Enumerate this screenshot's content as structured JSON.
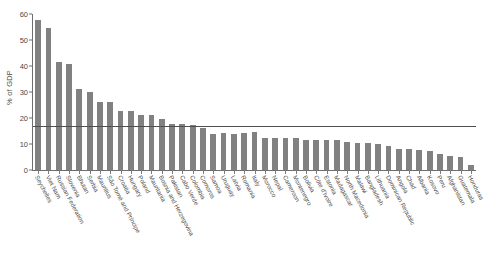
{
  "chart_data": {
    "type": "bar",
    "title": "",
    "xlabel": "",
    "ylabel": "% of GDP",
    "ylim": [
      0,
      60
    ],
    "yticks": [
      0,
      10,
      20,
      30,
      40,
      50,
      60
    ],
    "grid": false,
    "legend": null,
    "bar_color": "#818181",
    "axis_color": "#6e6e6e",
    "reference_line": {
      "value": 16.5,
      "color": "#4f4f4f",
      "orientation": "horizontal"
    },
    "categories": [
      "Seychelles",
      "Viet Nam",
      "Russian Federation",
      "Slovenia",
      "Bhutan",
      "Serbia",
      "Mauritius",
      "São Tomé and Príncipe",
      "Croatia",
      "Hungary",
      "Poland",
      "Mauritania",
      "Bosnia and Herzegovina",
      "Pakistan",
      "Cabo Verde",
      "Colombia",
      "Comoros",
      "Samoa",
      "Uruguay",
      "Latvia",
      "Romania",
      "Italy",
      "Morocco",
      "Nepal",
      "Cameroon",
      "Montenegro",
      "Bolivia",
      "Côte d'Ivoire",
      "Estonia",
      "Madagascar",
      "North Macedonia",
      "Malawi",
      "Bangladesh",
      "Lithuania",
      "Dominican Republic",
      "Angola",
      "Chad",
      "Albania",
      "Kosovo",
      "Peru",
      "Afghanistan",
      "Guatemala",
      "Honduras"
    ],
    "values": [
      57.8,
      54.6,
      41.7,
      40.8,
      31.0,
      30.0,
      26.0,
      26.0,
      22.8,
      22.7,
      21.0,
      21.0,
      19.8,
      17.8,
      17.6,
      17.5,
      16.0,
      14.0,
      14.2,
      14.0,
      14.2,
      14.5,
      12.2,
      12.4,
      12.4,
      12.5,
      11.6,
      11.6,
      11.6,
      11.5,
      10.6,
      10.4,
      10.2,
      9.9,
      9.3,
      8.1,
      8.0,
      7.6,
      7.2,
      6.1,
      5.2,
      5.1,
      2.0
    ]
  }
}
